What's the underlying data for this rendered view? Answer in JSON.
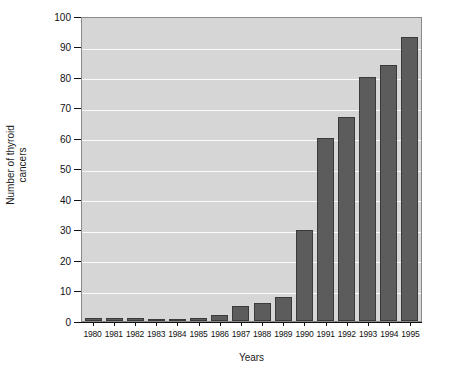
{
  "chart_data": {
    "type": "bar",
    "title": "",
    "xlabel": "Years",
    "ylabel_line1": "Number of thyroid",
    "ylabel_line2": "cancers",
    "ylabel": "Number of thyroid cancers",
    "categories": [
      "1980",
      "1981",
      "1982",
      "1983",
      "1984",
      "1985",
      "1986",
      "1987",
      "1988",
      "1989",
      "1990",
      "1991",
      "1992",
      "1993",
      "1994",
      "1995"
    ],
    "values": [
      1,
      1,
      1,
      0,
      0,
      1,
      2,
      5,
      6,
      8,
      30,
      60,
      67,
      80,
      84,
      93
    ],
    "ylim": [
      0,
      100
    ],
    "yticks": [
      0,
      10,
      20,
      30,
      40,
      50,
      60,
      70,
      80,
      90,
      100
    ],
    "ytick_labels": [
      "0",
      "10",
      "20",
      "30",
      "40",
      "50",
      "60",
      "70",
      "80",
      "90",
      "100"
    ],
    "grid": "horizontal",
    "legend": "none",
    "colors": {
      "bar_fill": "#5c5c5c",
      "bar_edge": "#3a3a3a",
      "plot_background": "#d6d6d6",
      "gridline": "#fbfbfb",
      "axis": "#111111",
      "text": "#1a1a1a",
      "figure_background": "#ffffff"
    }
  }
}
